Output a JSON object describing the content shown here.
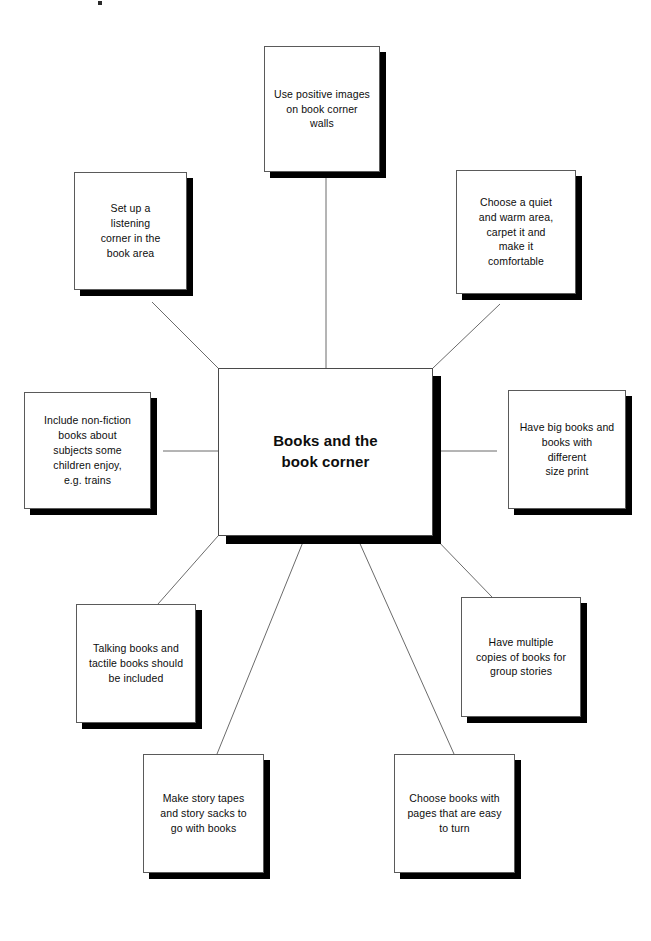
{
  "diagram": {
    "type": "mind-map",
    "title": "Books and the book corner",
    "central_node": {
      "label": "Books and the\nbook corner"
    },
    "nodes": [
      {
        "id": "top",
        "label": "Use positive images\non book corner\nwalls"
      },
      {
        "id": "top-left",
        "label": "Set up a\nlistening\ncorner in the\nbook area"
      },
      {
        "id": "top-right",
        "label": "Choose a quiet\nand warm area,\ncarpet it and\nmake it\ncomfortable"
      },
      {
        "id": "left",
        "label": "Include non-fiction\nbooks about\nsubjects some\nchildren enjoy,\ne.g. trains"
      },
      {
        "id": "right",
        "label": "Have big books and\nbooks with\ndifferent\nsize print"
      },
      {
        "id": "bottom-left",
        "label": "Talking books and\ntactile books should\nbe included"
      },
      {
        "id": "bottom-right",
        "label": "Have multiple\ncopies of books for\ngroup stories"
      },
      {
        "id": "bottom-far-left",
        "label": "Make story tapes\nand story sacks to\ngo with books"
      },
      {
        "id": "bottom-far-right",
        "label": "Choose books with\npages that are easy\nto turn"
      }
    ],
    "colors": {
      "background": "#ffffff",
      "box_fill": "#ffffff",
      "box_border": "#5a5a5a",
      "shadow": "#000000",
      "text": "#0d0d0d",
      "connector": "#6b6b6b"
    }
  }
}
